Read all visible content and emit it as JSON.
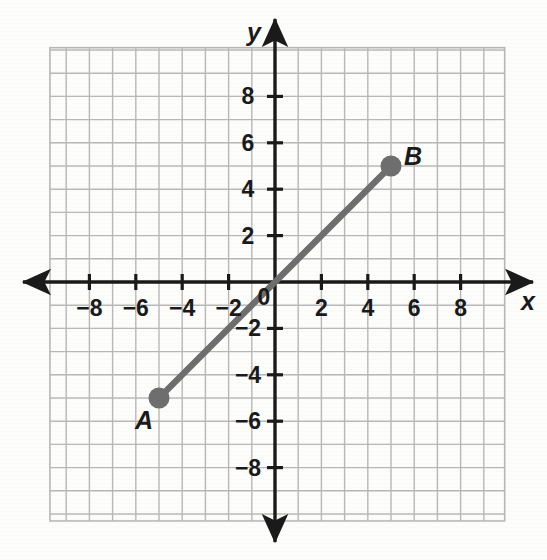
{
  "figure": {
    "kind": "coordinate-plane",
    "background_color": "#fdfdfc",
    "grid_color": "#b8b8b8",
    "axis_color": "#1a1a1a",
    "segment_color": "#6e6e6e",
    "label_color": "#1a1a1a"
  },
  "axes": {
    "x_label": "x",
    "y_label": "y",
    "origin_label": "0",
    "x_ticks": [
      "−8",
      "−6",
      "−4",
      "−2",
      "2",
      "4",
      "6",
      "8"
    ],
    "x_tick_values": [
      -8,
      -6,
      -4,
      -2,
      2,
      4,
      6,
      8
    ],
    "y_ticks": [
      "8",
      "6",
      "4",
      "2",
      "−2",
      "−4",
      "−6",
      "−8"
    ],
    "y_tick_values": [
      8,
      6,
      4,
      2,
      -2,
      -4,
      -6,
      -8
    ],
    "xlim": [
      -9.7,
      9.9
    ],
    "ylim": [
      -10.3,
      10.1
    ],
    "grid": "on",
    "grid_step": 1,
    "tick_step": 2
  },
  "chart_data": {
    "type": "scatter",
    "title": "",
    "xlabel": "x",
    "ylabel": "y",
    "xlim": [
      -9.7,
      9.9
    ],
    "ylim": [
      -10.3,
      10.1
    ],
    "grid": true,
    "legend": "none",
    "series": [
      {
        "name": "segment-AB",
        "kind": "line-segment-with-endpoints",
        "color": "#6e6e6e",
        "points": [
          {
            "label": "A",
            "x": -5,
            "y": -5
          },
          {
            "label": "B",
            "x": 5,
            "y": 5
          }
        ]
      }
    ],
    "annotations": [
      {
        "text": "A",
        "x": -5,
        "y": -5,
        "placement": "below-left"
      },
      {
        "text": "B",
        "x": 5,
        "y": 5,
        "placement": "above-right"
      }
    ]
  },
  "points": [
    {
      "id": "A",
      "label": "A",
      "x": -5,
      "y": -5,
      "label_dx": -0.65,
      "label_dy": -0.95
    },
    {
      "id": "B",
      "label": "B",
      "x": 5,
      "y": 5,
      "label_dx": 0.95,
      "label_dy": 0.45
    }
  ]
}
